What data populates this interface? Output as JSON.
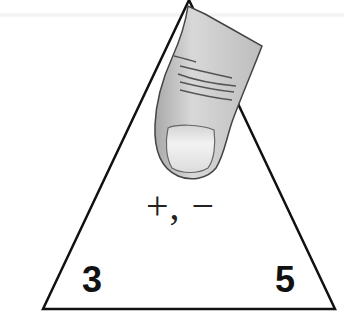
{
  "diagram": {
    "type": "fact-family-triangle",
    "operations": "+, −",
    "corners": {
      "top": "",
      "bottom_left": "3",
      "bottom_right": "5"
    },
    "top_corner_covered_by": "finger-icon"
  },
  "colors": {
    "stroke": "#111111",
    "finger_fill": "#c9c9c9",
    "nail_fill": "#e6e6e6",
    "background": "#ffffff"
  }
}
